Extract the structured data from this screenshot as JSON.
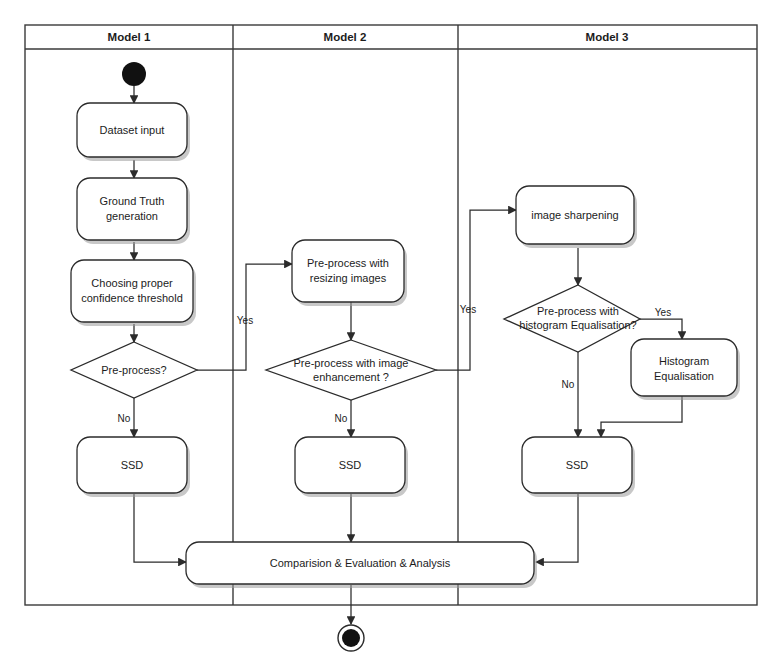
{
  "diagram": {
    "colors": {
      "stroke": "#2b2b2b",
      "frame_stroke": "#3a3a3a",
      "fill": "#ffffff",
      "text": "#1c1c1c",
      "shadow": "#9a9a9a"
    },
    "lanes": [
      {
        "id": "lane1",
        "label": "Model 1"
      },
      {
        "id": "lane2",
        "label": "Model 2"
      },
      {
        "id": "lane3",
        "label": "Model 3"
      }
    ],
    "nodes": {
      "start": {
        "label": "",
        "icon": "start-node-icon"
      },
      "dataset_input": {
        "label": "Dataset input"
      },
      "ground_truth": {
        "label_line1": "Ground Truth",
        "label_line2": "generation"
      },
      "choosing_threshold": {
        "label_line1": "Choosing proper",
        "label_line2": "confidence threshold"
      },
      "preprocess_decision": {
        "label": "Pre-process?"
      },
      "ssd_1": {
        "label": "SSD"
      },
      "resizing": {
        "label_line1": "Pre-process with",
        "label_line2": "resizing images"
      },
      "enhancement_decision": {
        "label_line1": "Pre-process with image",
        "label_line2": "enhancement ?"
      },
      "ssd_2": {
        "label": "SSD"
      },
      "image_sharpening": {
        "label": "image sharpening"
      },
      "histogram_decision": {
        "label_line1": "Pre-process with",
        "label_line2": "histogram Equalisation?"
      },
      "histogram_equalisation": {
        "label_line1": "Histogram",
        "label_line2": "Equalisation"
      },
      "ssd_3": {
        "label": "SSD"
      },
      "comparison": {
        "label": "Comparision & Evaluation & Analysis"
      },
      "final": {
        "label": "",
        "icon": "final-node-icon"
      }
    },
    "edge_labels": {
      "preprocess_yes": "Yes",
      "preprocess_no": "No",
      "enhancement_yes": "Yes",
      "enhancement_no": "No",
      "histogram_yes": "Yes",
      "histogram_no": "No"
    }
  }
}
